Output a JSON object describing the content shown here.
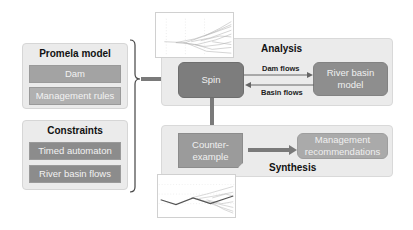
{
  "inputs": {
    "promela": {
      "title": "Promela model",
      "items": [
        "Dam",
        "Management rules"
      ]
    },
    "constraints": {
      "title": "Constraints",
      "items": [
        "Timed automaton",
        "River basin flows"
      ]
    }
  },
  "analysis": {
    "title": "Analysis",
    "spin_label": "Spin",
    "river_model_label_line1": "River basin",
    "river_model_label_line2": "model",
    "edge_forward": "Dam flows",
    "edge_back": "Basin flows"
  },
  "synthesis": {
    "title": "Synthesis",
    "counter_label_line1": "Counter-",
    "counter_label_line2": "example",
    "mgmt_label_line1": "Management",
    "mgmt_label_line2": "recommendations"
  },
  "colors": {
    "panel_bg": "#ebebeb",
    "spin": "#7d7d7d",
    "river": "#8e8e8e",
    "arrow": "#7a7a7a"
  }
}
